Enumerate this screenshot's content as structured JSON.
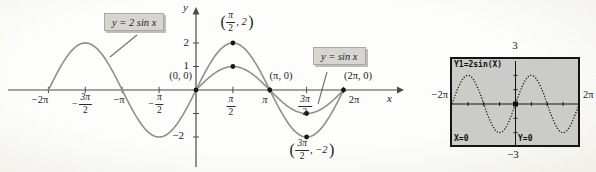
{
  "figure": {
    "callout_2sinx": "y = 2 sin x",
    "callout_sinx": "y = sin x",
    "axis_x": "x",
    "axis_y": "y",
    "y_ticks": {
      "t2": "2",
      "t1": "1",
      "tm2": "−2"
    },
    "x_ticks": [
      {
        "label": "−2π"
      },
      {
        "sign": "−",
        "num": "3π",
        "den": "2"
      },
      {
        "label": "−π"
      },
      {
        "sign": "−",
        "num": "π",
        "den": "2"
      },
      {
        "num": "π",
        "den": "2"
      },
      {
        "label": "π"
      },
      {
        "num": "3π",
        "den": "2"
      },
      {
        "label": "2π"
      }
    ],
    "point_labels": {
      "origin": "(0, 0)",
      "pi_zero": "(π, 0)",
      "two_pi_zero": "(2π, 0)",
      "max_two": {
        "open": "(",
        "num": "π",
        "den": "2",
        "rest": ", 2",
        "close": ")"
      },
      "min_two": {
        "open": "(",
        "num": "3π",
        "den": "2",
        "rest": ", −2",
        "close": ")"
      }
    }
  },
  "calculator": {
    "formula": "Y1=2sin(X)",
    "ymax": "3",
    "ymin": "−3",
    "xmin": "−2π",
    "xmax": "2π",
    "x_readout": "X=0",
    "y_readout": "Y=0"
  },
  "colors": {
    "curve": "#8f8f8f",
    "axis": "#4a4a4a",
    "text": "#1f1f1f",
    "callout_bg": "#d6d5d1",
    "calc_screen_bg": "#cbcbc7",
    "calc_ink": "#111111"
  },
  "chart_data": [
    {
      "type": "line",
      "title": "",
      "xlabel": "x",
      "ylabel": "y",
      "xlim_pi": [
        -2.15,
        2.3
      ],
      "ylim": [
        -2.6,
        2.6
      ],
      "grid": false,
      "x_tick_labels": [
        "−2π",
        "−3π/2",
        "−π",
        "−π/2",
        "π/2",
        "π",
        "3π/2",
        "2π"
      ],
      "y_tick_labels": [
        "2",
        "1",
        "−2"
      ],
      "legend_position": "callout-boxes",
      "series": [
        {
          "name": "y = 2 sin x",
          "amplitude": 2,
          "x_start_pi": -2,
          "x_end_pi": 2,
          "sample_x_pi": [
            -2,
            -1.5,
            -1,
            -0.5,
            0,
            0.5,
            1,
            1.5,
            2
          ],
          "sample_y": [
            0,
            2,
            0,
            -2,
            0,
            2,
            0,
            -2,
            0
          ]
        },
        {
          "name": "y = sin x",
          "amplitude": 1,
          "x_start_pi": 0,
          "x_end_pi": 2,
          "sample_x_pi": [
            0,
            0.5,
            1,
            1.5,
            2
          ],
          "sample_y": [
            0,
            1,
            0,
            -1,
            0
          ]
        }
      ],
      "marked_points": [
        {
          "x_pi": 0,
          "y": 0,
          "label": "(0, 0)"
        },
        {
          "x_pi": 0.5,
          "y": 2,
          "label": "(π/2, 2)"
        },
        {
          "x_pi": 0.5,
          "y": 1,
          "label": ""
        },
        {
          "x_pi": 1,
          "y": 0,
          "label": "(π, 0)"
        },
        {
          "x_pi": 1.5,
          "y": -1,
          "label": ""
        },
        {
          "x_pi": 1.5,
          "y": -2,
          "label": "(3π/2, −2)"
        },
        {
          "x_pi": 2,
          "y": 0,
          "label": "(2π, 0)"
        }
      ]
    },
    {
      "type": "line",
      "title": "Y1=2sin(X)",
      "style": "calculator-dot-plot",
      "xlim_labels": [
        "−2π",
        "2π"
      ],
      "ylim": [
        -3,
        3
      ],
      "trace": {
        "X": 0,
        "Y": 0
      },
      "series": [
        {
          "name": "Y1=2sin(X)",
          "amplitude": 2,
          "x_start_pi": -2,
          "x_end_pi": 2
        }
      ]
    }
  ]
}
